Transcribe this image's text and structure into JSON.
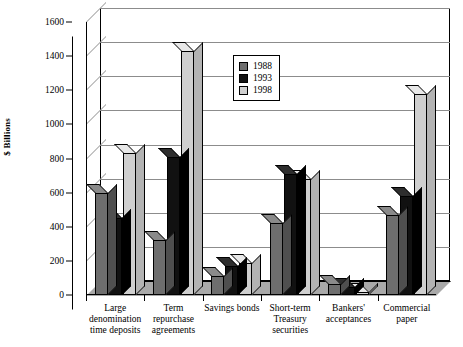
{
  "chart_data": {
    "type": "bar",
    "title": "",
    "xlabel": "",
    "ylabel": "$ Billions",
    "ylim": [
      0,
      1600
    ],
    "ytick_step": 200,
    "yticks": [
      0,
      200,
      400,
      600,
      800,
      1000,
      1200,
      1400,
      1600
    ],
    "grid": true,
    "legend_position": "upper-center",
    "style": "3d-grouped-column",
    "categories": [
      "Large\ndenomination\ntime deposits",
      "Term\nrepurchase\nagreements",
      "Savings bonds",
      "Short-term\nTreasury\nsecurities",
      "Bankers'\nacceptances",
      "Commercial\npaper"
    ],
    "series": [
      {
        "name": "1988",
        "color": "#6e6e6e",
        "values": [
          600,
          320,
          110,
          420,
          65,
          470
        ]
      },
      {
        "name": "1993",
        "color": "#111111",
        "values": [
          450,
          810,
          170,
          710,
          45,
          580
        ]
      },
      {
        "name": "1998",
        "color": "#cfcfcf",
        "values": [
          830,
          1430,
          185,
          680,
          20,
          1180
        ]
      }
    ]
  },
  "legend": {
    "entries": [
      {
        "label": "1988",
        "color": "#6e6e6e"
      },
      {
        "label": "1993",
        "color": "#111111"
      },
      {
        "label": "1998",
        "color": "#cfcfcf"
      }
    ]
  },
  "axis": {
    "y_title": "$ Billions"
  }
}
